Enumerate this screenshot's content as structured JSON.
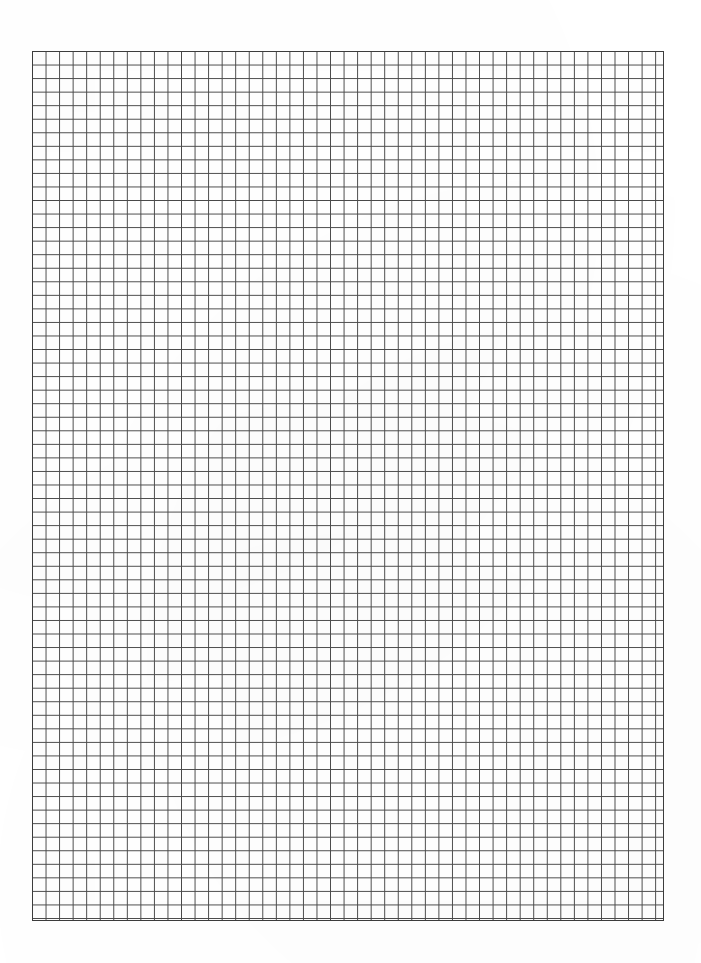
{
  "document": {
    "type": "graph-paper",
    "title": "Blank graph paper sheet",
    "description": "Scanned sheet of blank square-ruled graph paper with uniform grid and white margins",
    "orientation": "portrait",
    "page_width_px": 701,
    "page_height_px": 963,
    "background_color": "#ffffff",
    "has_text": false,
    "has_handwriting": false,
    "has_header": false,
    "has_footer": false,
    "has_page_number": false
  },
  "grid": {
    "label": "square-ruled grid",
    "left_px": 32,
    "top_px": 51,
    "width_px": 632,
    "height_px": 870,
    "cell_size_px": 13.55,
    "columns": 47,
    "rows": 64,
    "line_color": "#4a4a4a",
    "line_width_px": 1,
    "minor_line_color": "#6e6e6e",
    "has_major_lines": false,
    "major_every": 0,
    "uniform_weight": true,
    "border_color": "#3d3d3d",
    "border_width_px": 1,
    "cell_fill_color": "#ffffff"
  },
  "margins": {
    "left_px": 32,
    "right_px": 37,
    "top_px": 51,
    "bottom_px": 42,
    "color": "#ffffff"
  }
}
